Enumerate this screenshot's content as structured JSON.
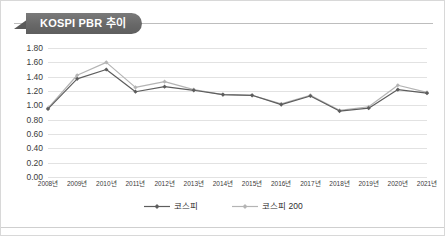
{
  "figure": {
    "title": "KOSPI PBR 추이",
    "title_icon": "ribbon-banner"
  },
  "chart_data": {
    "type": "line",
    "title": "KOSPI PBR 추이",
    "xlabel": "",
    "ylabel": "",
    "categories": [
      "2008년",
      "2009년",
      "2010년",
      "2011년",
      "2012년",
      "2013년",
      "2014년",
      "2015년",
      "2016년",
      "2017년",
      "2018년",
      "2019년",
      "2020년",
      "2021년"
    ],
    "series": [
      {
        "name": "코스피",
        "color": "#5d5d5d",
        "marker": "diamond",
        "values": [
          0.95,
          1.37,
          1.5,
          1.19,
          1.26,
          1.21,
          1.15,
          1.14,
          1.01,
          1.13,
          0.92,
          0.96,
          1.22,
          1.17
        ]
      },
      {
        "name": "코스피 200",
        "color": "#b4b4b4",
        "marker": "diamond",
        "values": [
          0.96,
          1.42,
          1.6,
          1.25,
          1.33,
          1.22,
          1.15,
          1.14,
          1.02,
          1.14,
          0.93,
          0.98,
          1.28,
          1.18
        ]
      }
    ],
    "ylim": [
      0.0,
      1.8
    ],
    "yticks": [
      "0.00",
      "0.20",
      "0.40",
      "0.60",
      "0.80",
      "1.00",
      "1.20",
      "1.40",
      "1.60",
      "1.80"
    ],
    "ytick_values": [
      0.0,
      0.2,
      0.4,
      0.6,
      0.8,
      1.0,
      1.2,
      1.4,
      1.6,
      1.8
    ],
    "grid": true,
    "legend_position": "bottom-center"
  },
  "legend": {
    "entries": [
      {
        "label": "코스피",
        "color": "#5d5d5d"
      },
      {
        "label": "코스피 200",
        "color": "#b4b4b4"
      }
    ]
  }
}
